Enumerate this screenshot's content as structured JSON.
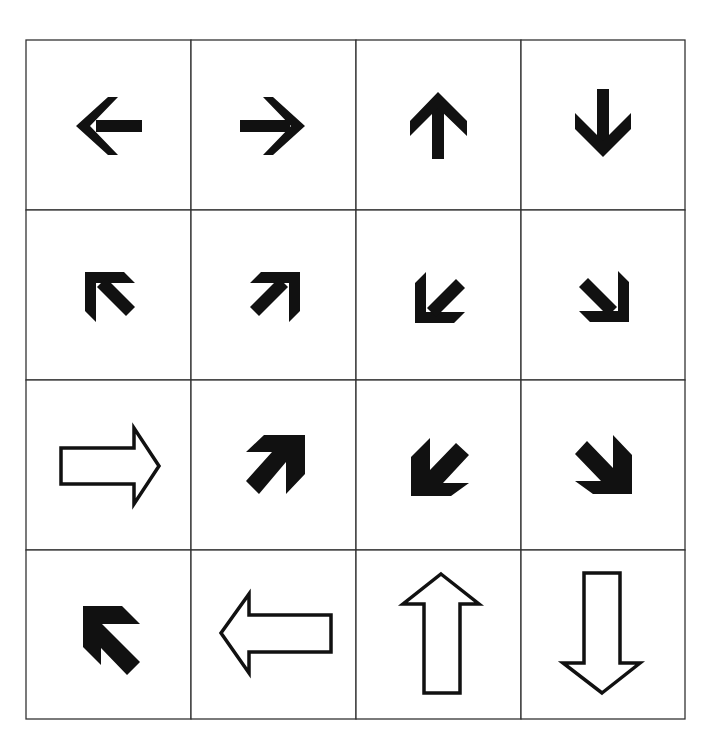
{
  "grid": {
    "rows": 4,
    "cols": 4,
    "line_color": "#333333",
    "arrow_color": "#111111",
    "cells": [
      {
        "row": 1,
        "col": 1,
        "icon": "arrow-left-icon",
        "direction": "left",
        "style": "solid-thin"
      },
      {
        "row": 1,
        "col": 2,
        "icon": "arrow-right-icon",
        "direction": "right",
        "style": "solid-thin"
      },
      {
        "row": 1,
        "col": 3,
        "icon": "arrow-up-icon",
        "direction": "up",
        "style": "solid-thin"
      },
      {
        "row": 1,
        "col": 4,
        "icon": "arrow-down-icon",
        "direction": "down",
        "style": "solid-thin"
      },
      {
        "row": 2,
        "col": 1,
        "icon": "arrow-up-left-icon",
        "direction": "up-left",
        "style": "solid-thin"
      },
      {
        "row": 2,
        "col": 2,
        "icon": "arrow-up-right-icon",
        "direction": "up-right",
        "style": "solid-thin"
      },
      {
        "row": 2,
        "col": 3,
        "icon": "arrow-down-left-icon",
        "direction": "down-left",
        "style": "solid-thin"
      },
      {
        "row": 2,
        "col": 4,
        "icon": "arrow-down-right-icon",
        "direction": "down-right",
        "style": "solid-thin"
      },
      {
        "row": 3,
        "col": 1,
        "icon": "arrow-right-outline-icon",
        "direction": "right",
        "style": "outline"
      },
      {
        "row": 3,
        "col": 2,
        "icon": "arrow-up-right-bold-icon",
        "direction": "up-right",
        "style": "solid-bold"
      },
      {
        "row": 3,
        "col": 3,
        "icon": "arrow-down-left-bold-icon",
        "direction": "down-left",
        "style": "solid-bold"
      },
      {
        "row": 3,
        "col": 4,
        "icon": "arrow-down-right-bold-icon",
        "direction": "down-right",
        "style": "solid-bold"
      },
      {
        "row": 4,
        "col": 1,
        "icon": "arrow-up-left-bold-icon",
        "direction": "up-left",
        "style": "solid-bold"
      },
      {
        "row": 4,
        "col": 2,
        "icon": "arrow-left-outline-icon",
        "direction": "left",
        "style": "outline"
      },
      {
        "row": 4,
        "col": 3,
        "icon": "arrow-up-outline-icon",
        "direction": "up",
        "style": "outline"
      },
      {
        "row": 4,
        "col": 4,
        "icon": "arrow-down-outline-icon",
        "direction": "down",
        "style": "outline"
      }
    ]
  }
}
